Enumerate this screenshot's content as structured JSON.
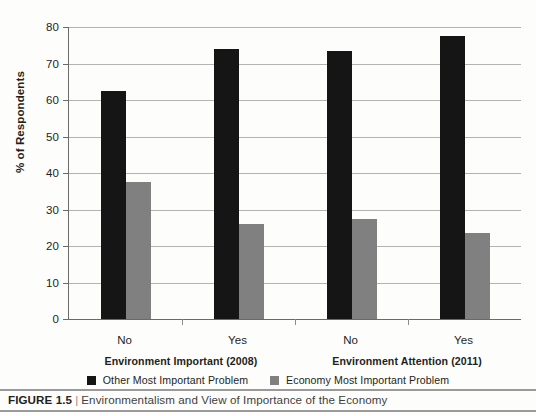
{
  "figure": {
    "number": "FIGURE 1.5",
    "separator": "|",
    "caption": "Environmentalism and View of Importance of the Economy"
  },
  "colors": {
    "series_other": "#151515",
    "series_economy": "#808080",
    "axis": "#6a6a6a",
    "gridline": "#b3b3b3",
    "text": "#231f20"
  },
  "legend": {
    "items": [
      {
        "label": "Other Most Important Problem",
        "color": "#151515",
        "swatch": "square-swatch"
      },
      {
        "label": "Economy Most Important Problem",
        "color": "#808080",
        "swatch": "square-swatch"
      }
    ]
  },
  "chart_data": {
    "type": "bar",
    "title": "",
    "subtitle": "",
    "xlabel": "",
    "ylabel": "% of Respondents",
    "ylim": [
      0,
      80
    ],
    "yticks": [
      0,
      10,
      20,
      30,
      40,
      50,
      60,
      70,
      80
    ],
    "ytick_labels": [
      "0",
      "10",
      "20",
      "30",
      "40",
      "50",
      "60",
      "70",
      "80"
    ],
    "grid": true,
    "legend_position": "bottom-center",
    "categories": [
      "No",
      "Yes",
      "No",
      "Yes"
    ],
    "groups": [
      {
        "label": "Environment Important (2008)",
        "categories": [
          "No",
          "Yes"
        ]
      },
      {
        "label": "Environment Attention (2011)",
        "categories": [
          "No",
          "Yes"
        ]
      }
    ],
    "series": [
      {
        "name": "Other Most Important Problem",
        "color": "#151515",
        "values": [
          62.5,
          74.0,
          73.5,
          77.5
        ]
      },
      {
        "name": "Economy Most Important Problem",
        "color": "#808080",
        "values": [
          37.5,
          26.0,
          27.5,
          23.5
        ]
      }
    ]
  }
}
